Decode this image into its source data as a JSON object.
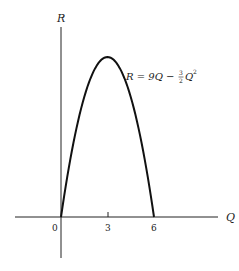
{
  "chart_data": {
    "type": "line",
    "title": "",
    "xlabel": "Q",
    "ylabel": "R",
    "equation_label": "R = 9Q − (3/2)Q²",
    "x_ticks": [
      "0",
      "3",
      "6"
    ],
    "x": [
      0,
      0.5,
      1,
      1.5,
      2,
      2.5,
      3,
      3.5,
      4,
      4.5,
      5,
      5.5,
      6
    ],
    "series": [
      {
        "name": "R = 9Q - 1.5Q^2",
        "values": [
          0,
          4.125,
          7.5,
          10.125,
          12,
          13.125,
          13.5,
          13.125,
          12,
          10.125,
          7.5,
          4.125,
          0
        ]
      }
    ],
    "xlim": [
      -1,
      7.2
    ],
    "ylim": [
      -4,
      15
    ],
    "grid": false
  },
  "labels": {
    "q_axis": "Q",
    "r_axis": "R",
    "eq_main": "R = 9Q − ",
    "eq_num": "3",
    "eq_den": "2",
    "eq_tail": "Q",
    "eq_exp": "2",
    "tick_0": "0",
    "tick_3": "3",
    "tick_6": "6"
  }
}
